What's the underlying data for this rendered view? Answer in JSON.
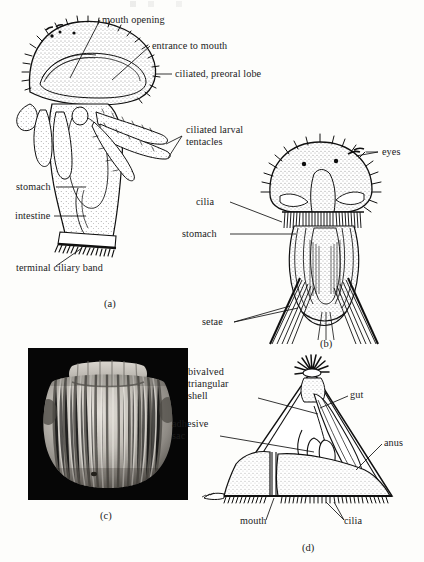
{
  "figure": {
    "domain_kind": "scientific-illustration",
    "background_color": "#fdfdfb",
    "ink_color": "#101010",
    "panels": [
      {
        "key": "a",
        "letter": "(a)",
        "caption_position": "below-left",
        "description": "lateral view of ciliated larva with preoral lobe, tentacles and gut",
        "labels": [
          {
            "id": "mouth-opening",
            "text": "mouth opening",
            "lines": [
              "mouth opening"
            ]
          },
          {
            "id": "entrance-to-mouth",
            "text": "entrance to mouth",
            "lines": [
              "entrance to mouth"
            ]
          },
          {
            "id": "ciliated-preoral-lobe",
            "text": "ciliated, preoral lobe",
            "lines": [
              "ciliated, preoral lobe"
            ]
          },
          {
            "id": "ciliated-larval-tentacles",
            "text": "ciliated larval tentacles",
            "lines": [
              "ciliated larval",
              "tentacles"
            ]
          },
          {
            "id": "stomach-a",
            "text": "stomach",
            "lines": [
              "stomach"
            ]
          },
          {
            "id": "intestine",
            "text": "intestine",
            "lines": [
              "intestine"
            ]
          },
          {
            "id": "terminal-ciliary-band",
            "text": "terminal ciliary band",
            "lines": [
              "terminal ciliary band"
            ]
          }
        ]
      },
      {
        "key": "b",
        "letter": "(b)",
        "caption_position": "below-center",
        "description": "ventral view of larva with eyespots, ciliary band, stomach and setal bundles",
        "labels": [
          {
            "id": "eyes",
            "text": "eyes",
            "lines": [
              "eyes"
            ]
          },
          {
            "id": "cilia-b",
            "text": "cilia",
            "lines": [
              "cilia"
            ]
          },
          {
            "id": "stomach-b",
            "text": "stomach",
            "lines": [
              "stomach"
            ]
          },
          {
            "id": "setae",
            "text": "setae",
            "lines": [
              "setae"
            ]
          }
        ]
      },
      {
        "key": "c",
        "letter": "(c)",
        "caption_position": "below-center",
        "description": "scanning electron micrograph of ribbed barrel-shaped larva on black background",
        "labels": []
      },
      {
        "key": "d",
        "letter": "(d)",
        "caption_position": "below-center",
        "description": "triangular bivalved larva in lateral view",
        "labels": [
          {
            "id": "bivalved-triangular-shell",
            "text": "bivalved triangular shell",
            "lines": [
              "bivalved",
              "triangular",
              "shell"
            ]
          },
          {
            "id": "gut",
            "text": "gut",
            "lines": [
              "gut"
            ]
          },
          {
            "id": "adhesive-sac",
            "text": "adhesive sac",
            "lines": [
              "adhesive",
              "sac"
            ]
          },
          {
            "id": "anus",
            "text": "anus",
            "lines": [
              "anus"
            ]
          },
          {
            "id": "mouth",
            "text": "mouth",
            "lines": [
              "mouth"
            ]
          },
          {
            "id": "cilia-d",
            "text": "cilia",
            "lines": [
              "cilia"
            ]
          }
        ]
      }
    ]
  },
  "text": {
    "a": {
      "mouth_opening": "mouth opening",
      "entrance_to_mouth": "entrance to mouth",
      "ciliated_preoral_lobe": "ciliated, preoral lobe",
      "ciliated_larval_1": "ciliated larval",
      "ciliated_larval_2": "tentacles",
      "stomach": "stomach",
      "intestine": "intestine",
      "terminal_ciliary_band": "terminal ciliary band",
      "letter": "(a)"
    },
    "b": {
      "eyes": "eyes",
      "cilia": "cilia",
      "stomach": "stomach",
      "setae": "setae",
      "letter": "(b)"
    },
    "c": {
      "letter": "(c)"
    },
    "d": {
      "shell_1": "bivalved",
      "shell_2": "triangular",
      "shell_3": "shell",
      "gut": "gut",
      "adhesive_1": "adhesive",
      "adhesive_2": "sac",
      "anus": "anus",
      "mouth": "mouth",
      "cilia": "cilia",
      "letter": "(d)"
    }
  }
}
